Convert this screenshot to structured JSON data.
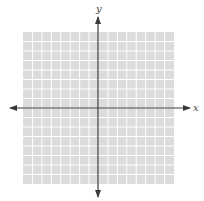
{
  "diagram": {
    "type": "coordinate-plane",
    "grid": {
      "columns": 16,
      "rows": 16,
      "background": "#dcdcdc",
      "line_color": "#ffffff"
    },
    "axes": {
      "x_label": "x",
      "y_label": "y",
      "color": "#3a3a3a"
    }
  }
}
